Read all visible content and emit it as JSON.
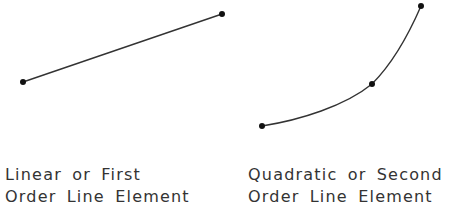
{
  "figures": [
    {
      "id": "linear",
      "caption_lines": [
        "Linear or First",
        "Order Line Element"
      ],
      "nodes": [
        {
          "x": 23,
          "y": 82
        },
        {
          "x": 222,
          "y": 14
        }
      ]
    },
    {
      "id": "quadratic",
      "caption_lines": [
        "Quadratic or Second",
        "Order Line Element"
      ],
      "nodes": [
        {
          "x": 262,
          "y": 126
        },
        {
          "x": 372,
          "y": 84
        },
        {
          "x": 421,
          "y": 6
        }
      ]
    }
  ],
  "colors": {
    "line": "#333333",
    "node": "#111111",
    "text": "#333333"
  }
}
